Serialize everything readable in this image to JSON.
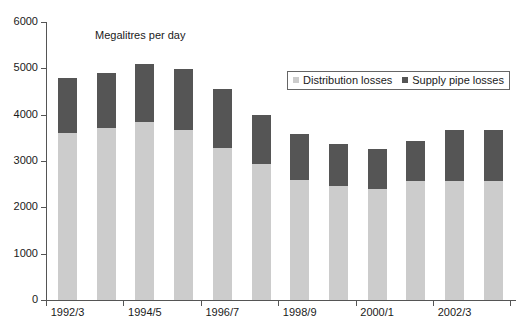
{
  "chart_data": {
    "type": "bar",
    "subtype": "stacked",
    "title": "Megalitres per day",
    "xlabel": "",
    "ylabel": "",
    "ylim": [
      0,
      6000
    ],
    "ytick_labels": [
      "0",
      "1000",
      "2000",
      "3000",
      "4000",
      "5000",
      "6000"
    ],
    "yticks": [
      0,
      1000,
      2000,
      3000,
      4000,
      5000,
      6000
    ],
    "grid": false,
    "legend_position": "upper-right-inside",
    "categories": [
      "1992/3",
      "1993/4",
      "1994/5",
      "1995/6",
      "1996/7",
      "1997/8",
      "1998/9",
      "1999/0",
      "2000/1",
      "2001/2",
      "2002/3",
      "2003/4"
    ],
    "visible_xtick_labels": [
      "1992/3",
      "1994/5",
      "1996/7",
      "1998/9",
      "2000/1",
      "2002/3"
    ],
    "series": [
      {
        "name": "Distribution losses",
        "color": "#cccccc",
        "values": [
          3600,
          3720,
          3850,
          3680,
          3280,
          2930,
          2580,
          2470,
          2390,
          2560,
          2570,
          2560
        ]
      },
      {
        "name": "Supply pipe losses",
        "color": "#555555",
        "values": [
          1200,
          1180,
          1250,
          1310,
          1270,
          1070,
          1010,
          890,
          860,
          880,
          1110,
          1100
        ]
      }
    ],
    "totals": [
      4800,
      4900,
      5100,
      4990,
      4550,
      4000,
      3590,
      3360,
      3250,
      3440,
      3680,
      3660
    ]
  },
  "legend": {
    "items": [
      {
        "label": "Distribution losses"
      },
      {
        "label": "Supply pipe losses"
      }
    ]
  },
  "colors": {
    "distribution": "#cccccc",
    "supply_pipe": "#555555",
    "axis": "#555555",
    "text": "#1a1a1a",
    "background": "#ffffff"
  }
}
